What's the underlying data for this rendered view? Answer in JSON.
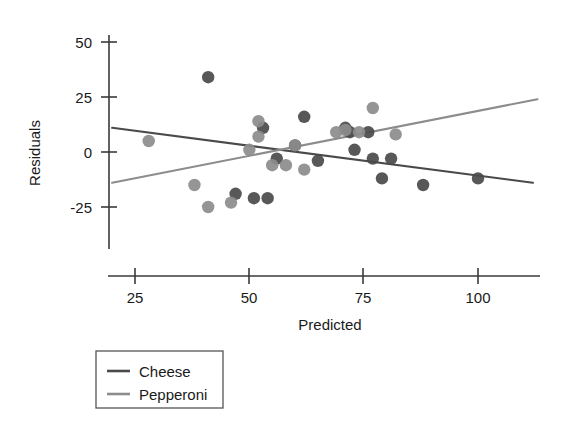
{
  "chart_data": {
    "type": "scatter",
    "title": "",
    "xlabel": "Predicted",
    "ylabel": "Residuals",
    "xlim": [
      20,
      116
    ],
    "ylim": [
      -33,
      57
    ],
    "xticks": [
      25,
      50,
      75,
      100
    ],
    "yticks": [
      -25,
      0,
      25,
      50
    ],
    "grid": false,
    "legend_position": "below-left",
    "series": [
      {
        "name": "Cheese",
        "color": "#4a4a4a",
        "marker": "circle",
        "points": [
          [
            41,
            34
          ],
          [
            53,
            11
          ],
          [
            56,
            -3
          ],
          [
            62,
            16
          ],
          [
            65,
            -4
          ],
          [
            71,
            11
          ],
          [
            72,
            9
          ],
          [
            73,
            1
          ],
          [
            76,
            9
          ],
          [
            77,
            -3
          ],
          [
            79,
            -12
          ],
          [
            81,
            -3
          ],
          [
            88,
            -15
          ],
          [
            100,
            -12
          ],
          [
            47,
            -19
          ],
          [
            51,
            -21
          ],
          [
            54,
            -21
          ],
          [
            60,
            3
          ]
        ],
        "trend_line": {
          "x_start": 20,
          "y_start": 11,
          "x_end": 112,
          "y_end": -14
        }
      },
      {
        "name": "Pepperoni",
        "color": "#8c8c8c",
        "marker": "circle",
        "points": [
          [
            28,
            5
          ],
          [
            38,
            -15
          ],
          [
            41,
            -25
          ],
          [
            46,
            -23
          ],
          [
            50,
            1
          ],
          [
            52,
            14
          ],
          [
            52,
            7
          ],
          [
            55,
            -6
          ],
          [
            58,
            -6
          ],
          [
            60,
            3
          ],
          [
            62,
            -8
          ],
          [
            69,
            9
          ],
          [
            71,
            10
          ],
          [
            74,
            9
          ],
          [
            77,
            20
          ],
          [
            82,
            8
          ]
        ],
        "trend_line": {
          "x_start": 20,
          "y_start": -14,
          "x_end": 113,
          "y_end": 24
        }
      }
    ]
  },
  "legend": {
    "entries": [
      {
        "label": "Cheese",
        "color": "#4a4a4a"
      },
      {
        "label": "Pepperoni",
        "color": "#8c8c8c"
      }
    ]
  },
  "axes": {
    "x_title": "Predicted",
    "y_title": "Residuals",
    "x_tick_labels": [
      "25",
      "50",
      "75",
      "100"
    ],
    "y_tick_labels": [
      "50",
      "25",
      "0",
      "-25"
    ]
  }
}
